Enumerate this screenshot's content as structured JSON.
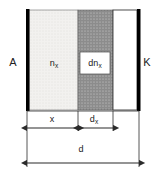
{
  "diagram": {
    "electrodes": {
      "anode": {
        "label": "A",
        "x": 13,
        "y": 62
      },
      "cathode": {
        "label": "K",
        "x": 146,
        "y": 62
      }
    },
    "regions": [
      {
        "name": "light-dotted-region",
        "label": "n",
        "subscript": "x",
        "fill_hex": "#f0efed",
        "pattern": "fine-dots",
        "x": 29,
        "y": 10,
        "width": 49,
        "height": 100,
        "label_x": 54,
        "label_y": 63
      },
      {
        "name": "dark-dotted-region",
        "label": "dn",
        "subscript": "x",
        "fill_hex": "#8c8c8c",
        "pattern": "fine-dots",
        "x": 78,
        "y": 10,
        "width": 35,
        "height": 100,
        "label_x": 95,
        "label_y": 63
      },
      {
        "name": "white-region",
        "label": "",
        "subscript": "",
        "fill_hex": "#ffffff",
        "pattern": "none",
        "x": 113,
        "y": 10,
        "width": 24,
        "height": 100
      }
    ],
    "bars": {
      "anode_bar": {
        "x": 26,
        "y": 9,
        "width": 3.5,
        "height": 102,
        "fill_hex": "#000000"
      },
      "cathode_bar": {
        "x": 137,
        "y": 9,
        "width": 3.5,
        "height": 102,
        "fill_hex": "#000000"
      }
    },
    "callout_box": {
      "name": "dn-label-box",
      "x": 80,
      "y": 52,
      "width": 30,
      "height": 22,
      "fill_hex": "#ffffff",
      "stroke_hex": "#000000"
    },
    "dimensions": [
      {
        "name": "dimension-x",
        "label": "x",
        "subscript": "",
        "x1": 27,
        "x2": 78,
        "y": 128,
        "label_x": 52,
        "label_y": 120
      },
      {
        "name": "dimension-dx",
        "label": "d",
        "subscript": "x",
        "x1": 78,
        "x2": 113,
        "y": 128,
        "label_x": 93,
        "label_y": 120
      },
      {
        "name": "dimension-d",
        "label": "d",
        "subscript": "",
        "x1": 27,
        "x2": 139,
        "y": 163,
        "label_x": 81,
        "label_y": 150
      }
    ],
    "colors": {
      "line": "#2b2b2b",
      "dark_fill": "#8c8c8c",
      "light_fill": "#f0efed",
      "bar": "#000000",
      "background": "#ffffff"
    }
  }
}
